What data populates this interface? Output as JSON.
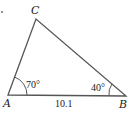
{
  "figure": {
    "type": "triangle",
    "vertices": {
      "A": {
        "label": "A"
      },
      "B": {
        "label": "B"
      },
      "C": {
        "label": "C"
      }
    },
    "angles": {
      "A": "70°",
      "B": "40°"
    },
    "sides": {
      "AB": "10.1"
    },
    "colors": {
      "stroke": "#555555",
      "text": "#222222",
      "background": "#ffffff"
    }
  }
}
